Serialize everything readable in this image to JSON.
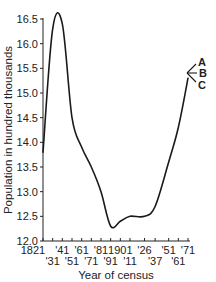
{
  "chart_data": {
    "type": "line",
    "title": "",
    "xlabel": "Year of census",
    "ylabel": "Population in hundred thousands",
    "ylim": [
      12.0,
      16.5
    ],
    "xlim": [
      1821,
      1971
    ],
    "grid": false,
    "legend": "none",
    "y_ticks": [
      "12.0",
      "12.5",
      "13.0",
      "13.5",
      "14.0",
      "14.5",
      "15.0",
      "15.5",
      "16.0",
      "16.5"
    ],
    "x_ticks_top_row": [
      "1821",
      "'41",
      "'61",
      "'81",
      "1901",
      "'26",
      "'51",
      "'71"
    ],
    "x_ticks_bottom_row": [
      "'31",
      "'51",
      "'71",
      "'91",
      "'11",
      "'37",
      "'61"
    ],
    "x_tick_years": [
      1821,
      1831,
      1841,
      1851,
      1861,
      1871,
      1881,
      1891,
      1901,
      1911,
      1926,
      1937,
      1951,
      1961,
      1971
    ],
    "series": [
      {
        "name": "Population",
        "x": [
          1821,
          1831,
          1841,
          1851,
          1861,
          1871,
          1881,
          1891,
          1901,
          1911,
          1926,
          1937,
          1951,
          1961,
          1971
        ],
        "values": [
          13.8,
          16.3,
          16.4,
          14.5,
          13.9,
          13.5,
          13.0,
          12.3,
          12.4,
          12.5,
          12.5,
          12.7,
          13.6,
          14.3,
          15.3
        ]
      }
    ],
    "annotations": [
      {
        "label": "A",
        "note": "projection branch upward"
      },
      {
        "label": "B",
        "note": "projection branch level"
      },
      {
        "label": "C",
        "note": "projection branch downward"
      }
    ]
  }
}
